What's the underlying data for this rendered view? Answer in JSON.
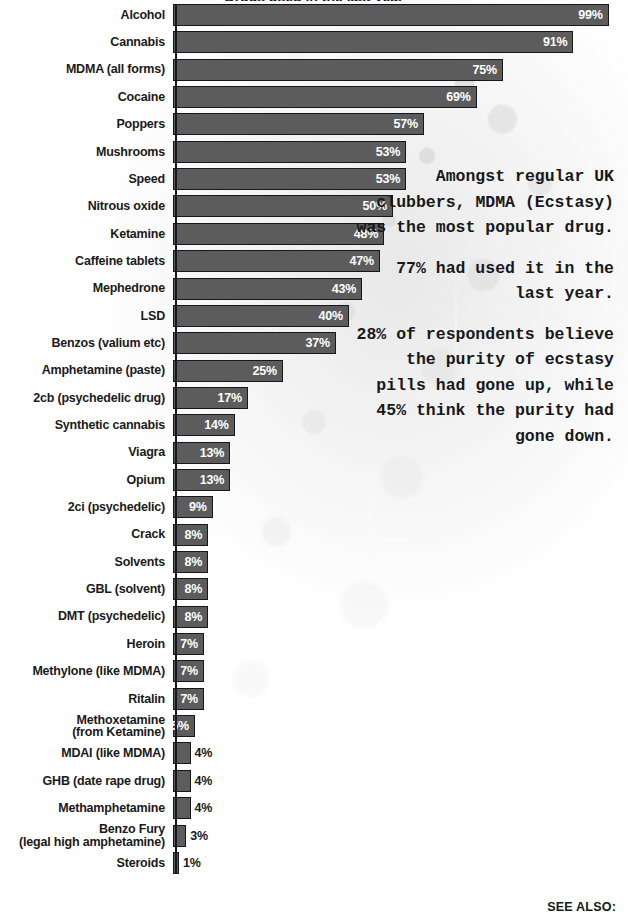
{
  "chart_data": {
    "type": "bar",
    "title": "Drugs used in the last year",
    "orientation": "horizontal",
    "xlabel": "",
    "ylabel": "",
    "xlim": [
      0,
      100
    ],
    "grid": false,
    "legend": null,
    "value_suffix": "%",
    "categories": [
      "Alcohol",
      "Cannabis",
      "MDMA (all forms)",
      "Cocaine",
      "Poppers",
      "Mushrooms",
      "Speed",
      "Nitrous oxide",
      "Ketamine",
      "Caffeine tablets",
      "Mephedrone",
      "LSD",
      "Benzos (valium etc)",
      "Amphetamine (paste)",
      "2cb (psychedelic drug)",
      "Synthetic cannabis",
      "Viagra",
      "Opium",
      "2ci (psychedelic)",
      "Crack",
      "Solvents",
      "GBL (solvent)",
      "DMT (psychedelic)",
      "Heroin",
      "Methylone (like MDMA)",
      "Ritalin",
      "Methoxetamine\n(from Ketamine)",
      "MDAI (like MDMA)",
      "GHB (date rape drug)",
      "Methamphetamine",
      "Benzo Fury\n(legal high amphetamine)",
      "Steroids"
    ],
    "values": [
      99,
      91,
      75,
      69,
      57,
      53,
      53,
      50,
      48,
      47,
      43,
      40,
      37,
      25,
      17,
      14,
      13,
      13,
      9,
      8,
      8,
      8,
      8,
      7,
      7,
      7,
      5,
      4,
      4,
      4,
      3,
      1
    ],
    "value_labels": [
      "99%",
      "91%",
      "75%",
      "69%",
      "57%",
      "53%",
      "53%",
      "50%",
      "48%",
      "47%",
      "43%",
      "40%",
      "37%",
      "25%",
      "17%",
      "14%",
      "13%",
      "13%",
      "9%",
      "8%",
      "8%",
      "8%",
      "8%",
      "7%",
      "7%",
      "7%",
      "5%",
      "4%",
      "4%",
      "4%",
      "3%",
      "1%"
    ],
    "label_placement": [
      "inside",
      "inside",
      "inside",
      "inside",
      "inside",
      "inside",
      "inside",
      "inside",
      "inside",
      "inside",
      "inside",
      "inside",
      "inside",
      "inside",
      "inside",
      "inside",
      "inside",
      "inside",
      "inside",
      "inside",
      "inside",
      "inside",
      "inside",
      "inside",
      "inside",
      "inside",
      "inside",
      "outside",
      "outside",
      "outside",
      "outside",
      "outside"
    ]
  },
  "callout": {
    "paragraphs": [
      "Amongst regular UK clubbers, MDMA (Ecstasy) was the most popular drug.",
      "77% had used it in the last year.",
      "28% of respondents believe the purity of ecstasy pills had gone up, while 45% think the purity had gone down."
    ]
  },
  "footer": {
    "see_also": "SEE ALSO:"
  },
  "colors": {
    "bar_fill": "#5c5c5c",
    "bar_border": "#15171a",
    "inside_label": "#ffffff",
    "outside_label": "#1a1a1a",
    "category_label": "#1a1a1a",
    "background": "#ffffff"
  }
}
